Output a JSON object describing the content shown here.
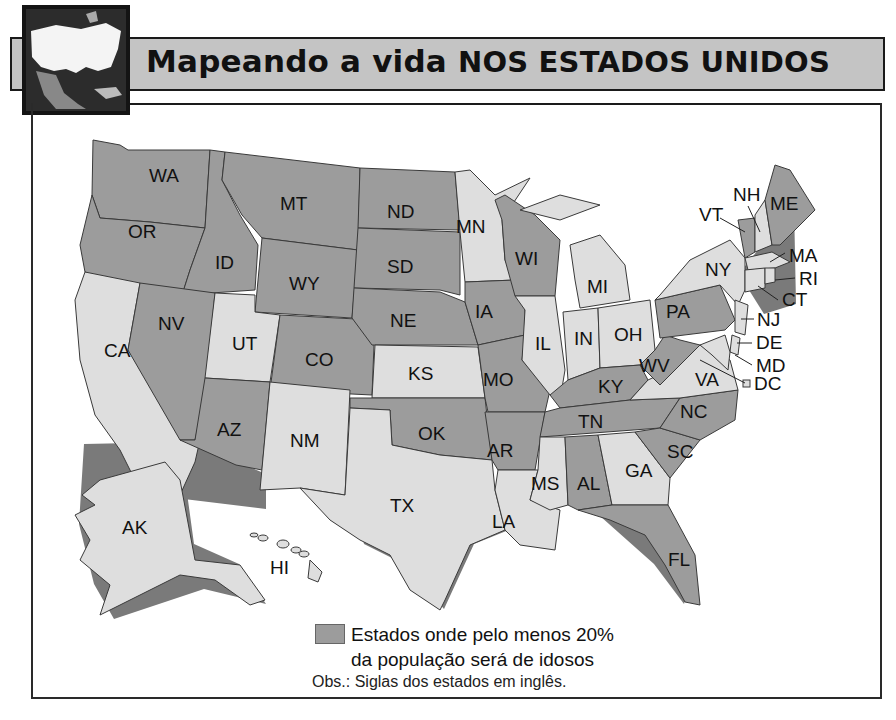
{
  "header": {
    "title_part1": "Mapeando a vida ",
    "title_part2": "NOS ESTADOS UNIDOS",
    "thumbnail": "north-america-map-thumbnail"
  },
  "map": {
    "colors": {
      "highlighted": "#9c9c9c",
      "other": "#dedede",
      "border": "#3a3a3a"
    },
    "highlighted_states": [
      "WA",
      "OR",
      "ID",
      "MT",
      "WY",
      "NV",
      "AZ",
      "CO",
      "ND",
      "SD",
      "NE",
      "OK",
      "IA",
      "MO",
      "AR",
      "WI",
      "KY",
      "TN",
      "AL",
      "FL",
      "SC",
      "NC",
      "WV",
      "PA",
      "VT",
      "ME"
    ],
    "other_states": [
      "CA",
      "UT",
      "NM",
      "TX",
      "KS",
      "MN",
      "IL",
      "MI",
      "IN",
      "OH",
      "MS",
      "LA",
      "GA",
      "VA",
      "NY",
      "NH",
      "MA",
      "RI",
      "CT",
      "NJ",
      "DE",
      "MD",
      "DC",
      "AK",
      "HI"
    ],
    "labels": {
      "WA": "WA",
      "OR": "OR",
      "CA": "CA",
      "ID": "ID",
      "NV": "NV",
      "MT": "MT",
      "WY": "WY",
      "UT": "UT",
      "AZ": "AZ",
      "CO": "CO",
      "NM": "NM",
      "ND": "ND",
      "SD": "SD",
      "NE": "NE",
      "KS": "KS",
      "OK": "OK",
      "TX": "TX",
      "MN": "MN",
      "IA": "IA",
      "MO": "MO",
      "AR": "AR",
      "LA": "LA",
      "WI": "WI",
      "IL": "IL",
      "MI": "MI",
      "IN": "IN",
      "OH": "OH",
      "KY": "KY",
      "TN": "TN",
      "MS": "MS",
      "AL": "AL",
      "GA": "GA",
      "FL": "FL",
      "SC": "SC",
      "NC": "NC",
      "VA": "VA",
      "WV": "WV",
      "PA": "PA",
      "NY": "NY",
      "VT": "VT",
      "NH": "NH",
      "ME": "ME",
      "MA": "MA",
      "RI": "RI",
      "CT": "CT",
      "NJ": "NJ",
      "DE": "DE",
      "MD": "MD",
      "DC": "DC",
      "AK": "AK",
      "HI": "HI"
    }
  },
  "legend": {
    "swatch_color": "#9c9c9c",
    "line1": "Estados onde pelo menos 20%",
    "line2": "da população será de idosos"
  },
  "note": "Obs.: Siglas dos estados em inglês."
}
